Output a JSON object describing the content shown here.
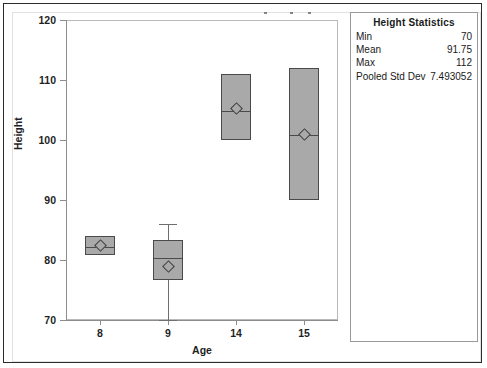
{
  "chart_data": {
    "type": "box",
    "title": "",
    "xlabel": "Age",
    "ylabel": "Height",
    "ylim": [
      70,
      120
    ],
    "yticks": [
      70,
      80,
      90,
      100,
      110,
      120
    ],
    "categories": [
      "8",
      "9",
      "14",
      "15"
    ],
    "grid": false,
    "legend": "none",
    "boxes": [
      {
        "category": "8",
        "q1": 80.8,
        "median": 82.2,
        "q3": 84.0,
        "mean": 82.4,
        "whisker_low": null,
        "whisker_high": null
      },
      {
        "category": "9",
        "q1": 76.7,
        "median": 80.3,
        "q3": 83.3,
        "mean": 79.0,
        "whisker_low": 70.0,
        "whisker_high": 86.0
      },
      {
        "category": "14",
        "q1": 100.0,
        "median": 104.8,
        "q3": 111.0,
        "mean": 105.3,
        "whisker_low": null,
        "whisker_high": null
      },
      {
        "category": "15",
        "q1": 90.0,
        "median": 100.8,
        "q3": 112.0,
        "mean": 100.9,
        "whisker_low": null,
        "whisker_high": null
      }
    ]
  },
  "stats_panel": {
    "title": "Height Statistics",
    "rows": [
      {
        "label": "Min",
        "value": "70"
      },
      {
        "label": "Mean",
        "value": "91.75"
      },
      {
        "label": "Max",
        "value": "112"
      },
      {
        "label": "Pooled Std Dev",
        "value": "7.493052"
      }
    ]
  },
  "colors": {
    "box_fill": "#a9a9a9",
    "box_border": "#4a4a4a",
    "whisker": "#6e6e6e",
    "axis": "#8d8d8d",
    "frame": "#2b2b2b",
    "text": "#1a1a1a"
  }
}
